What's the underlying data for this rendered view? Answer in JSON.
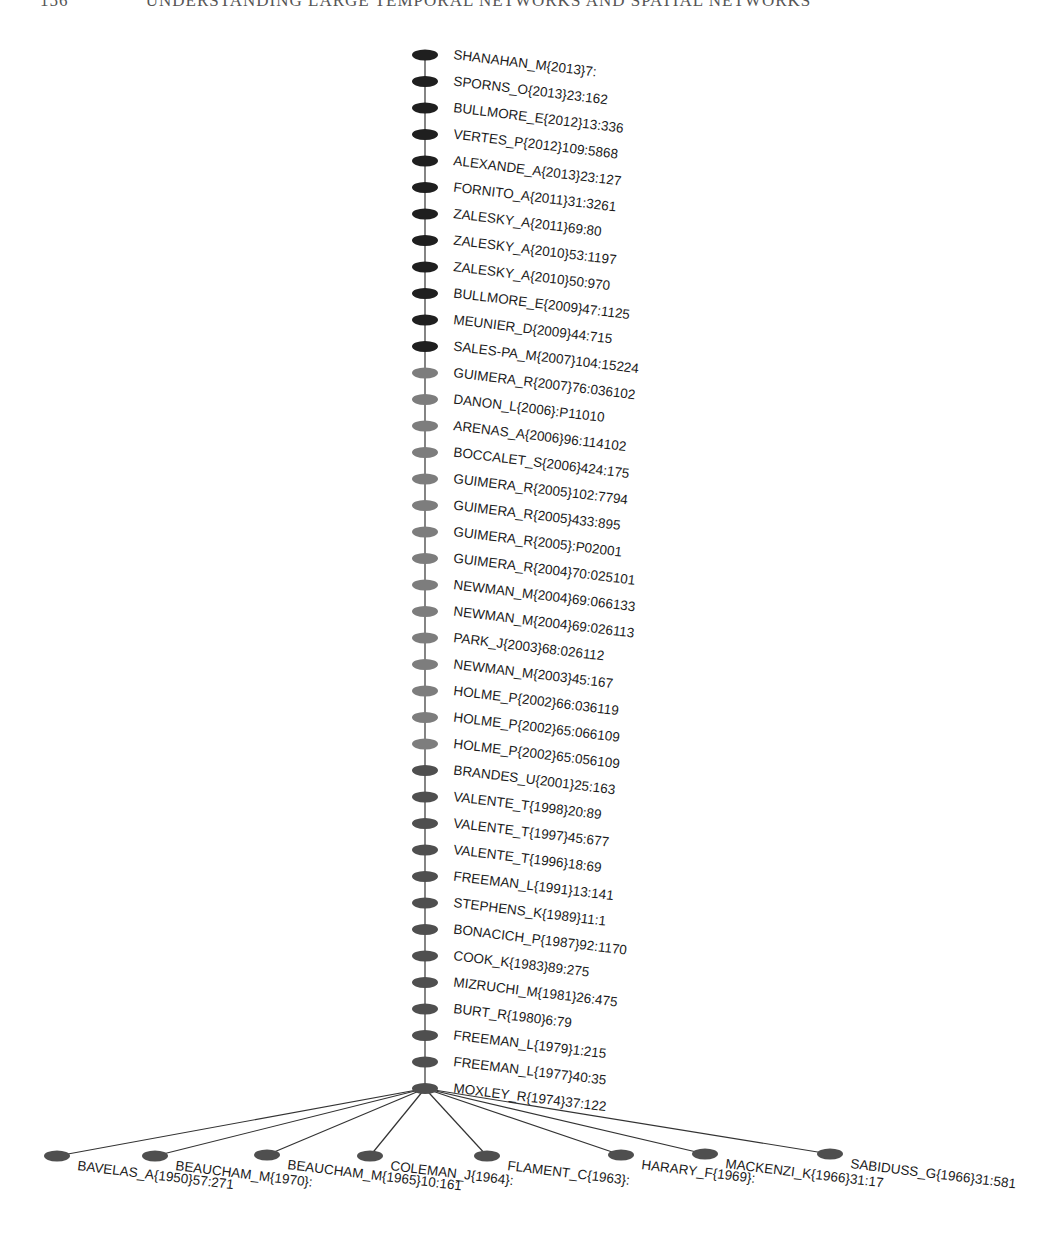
{
  "header": {
    "page_number": "156",
    "running_title": "UNDERSTANDING LARGE TEMPORAL NETWORKS AND SPATIAL NETWORKS"
  },
  "colors": {
    "dark_node": "#1f1f1f",
    "light_node": "#7d7d7d",
    "mid_node": "#4f4f4f",
    "edge": "#333333"
  },
  "main_path": [
    {
      "label": "SHANAHAN_M{2013}7:",
      "group": "dark"
    },
    {
      "label": "SPORNS_O{2013}23:162",
      "group": "dark"
    },
    {
      "label": "BULLMORE_E{2012}13:336",
      "group": "dark"
    },
    {
      "label": "VERTES_P{2012}109:5868",
      "group": "dark"
    },
    {
      "label": "ALEXANDE_A{2013}23:127",
      "group": "dark"
    },
    {
      "label": "FORNITO_A{2011}31:3261",
      "group": "dark"
    },
    {
      "label": "ZALESKY_A{2011}69:80",
      "group": "dark"
    },
    {
      "label": "ZALESKY_A{2010}53:1197",
      "group": "dark"
    },
    {
      "label": "ZALESKY_A{2010}50:970",
      "group": "dark"
    },
    {
      "label": "BULLMORE_E{2009}47:1125",
      "group": "dark"
    },
    {
      "label": "MEUNIER_D{2009}44:715",
      "group": "dark"
    },
    {
      "label": "SALES-PA_M{2007}104:15224",
      "group": "dark"
    },
    {
      "label": "GUIMERA_R{2007}76:036102",
      "group": "light"
    },
    {
      "label": "DANON_L{2006}:P11010",
      "group": "light"
    },
    {
      "label": "ARENAS_A{2006}96:114102",
      "group": "light"
    },
    {
      "label": "BOCCALET_S{2006}424:175",
      "group": "light"
    },
    {
      "label": "GUIMERA_R{2005}102:7794",
      "group": "light"
    },
    {
      "label": "GUIMERA_R{2005}433:895",
      "group": "light"
    },
    {
      "label": "GUIMERA_R{2005}:P02001",
      "group": "light"
    },
    {
      "label": "GUIMERA_R{2004}70:025101",
      "group": "light"
    },
    {
      "label": "NEWMAN_M{2004}69:066133",
      "group": "light"
    },
    {
      "label": "NEWMAN_M{2004}69:026113",
      "group": "light"
    },
    {
      "label": "PARK_J{2003}68:026112",
      "group": "light"
    },
    {
      "label": "NEWMAN_M{2003}45:167",
      "group": "light"
    },
    {
      "label": "HOLME_P{2002}66:036119",
      "group": "light"
    },
    {
      "label": "HOLME_P{2002}65:066109",
      "group": "light"
    },
    {
      "label": "HOLME_P{2002}65:056109",
      "group": "light"
    },
    {
      "label": "BRANDES_U{2001}25:163",
      "group": "mid"
    },
    {
      "label": "VALENTE_T{1998}20:89",
      "group": "mid"
    },
    {
      "label": "VALENTE_T{1997}45:677",
      "group": "mid"
    },
    {
      "label": "VALENTE_T{1996}18:69",
      "group": "mid"
    },
    {
      "label": "FREEMAN_L{1991}13:141",
      "group": "mid"
    },
    {
      "label": "STEPHENS_K{1989}11:1",
      "group": "mid"
    },
    {
      "label": "BONACICH_P{1987}92:1170",
      "group": "mid"
    },
    {
      "label": "COOK_K{1983}89:275",
      "group": "mid"
    },
    {
      "label": "MIZRUCHI_M{1981}26:475",
      "group": "mid"
    },
    {
      "label": "BURT_R{1980}6:79",
      "group": "mid"
    },
    {
      "label": "FREEMAN_L{1979}1:215",
      "group": "mid"
    },
    {
      "label": "FREEMAN_L{1977}40:35",
      "group": "mid"
    },
    {
      "label": "MOXLEY_R{1974}37:122",
      "group": "mid"
    }
  ],
  "fan_out": [
    {
      "label": "BAVELAS_A{1950}57:271",
      "x": 57,
      "y": 1156
    },
    {
      "label": "BEAUCHAM_M{1970}:",
      "x": 155,
      "y": 1156
    },
    {
      "label": "BEAUCHAM_M{1965}10:161",
      "x": 267,
      "y": 1155
    },
    {
      "label": "COLEMAN_J{1964}:",
      "x": 370,
      "y": 1156
    },
    {
      "label": "FLAMENT_C{1963}:",
      "x": 487,
      "y": 1156
    },
    {
      "label": "HARARY_F{1969}:",
      "x": 621,
      "y": 1155
    },
    {
      "label": "MACKENZI_K{1966}31:17",
      "x": 705,
      "y": 1154
    },
    {
      "label": "SABIDUSS_G{1966}31:581",
      "x": 830,
      "y": 1154
    }
  ]
}
